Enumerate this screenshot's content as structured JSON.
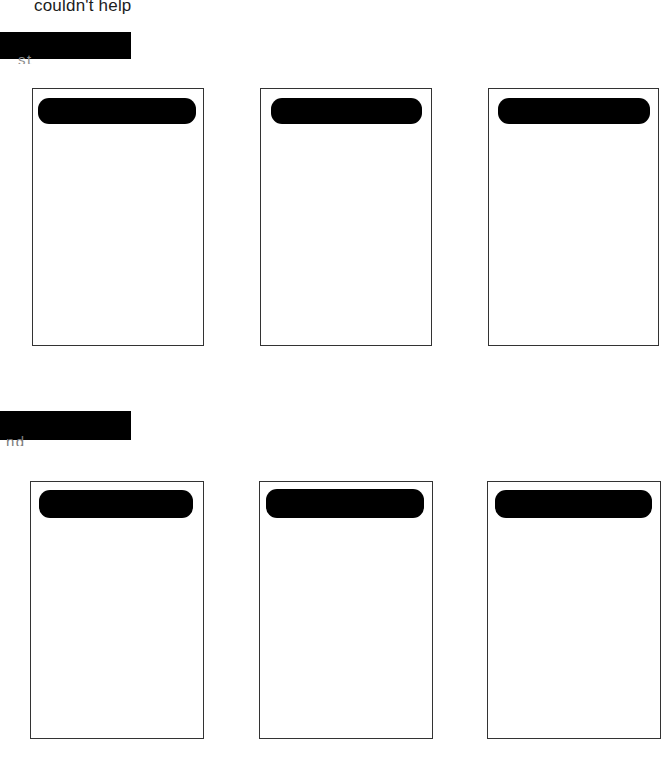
{
  "document": {
    "type": "scanned-document",
    "background_color": "#ffffff",
    "border_color": "#333333",
    "redaction_color": "#000000",
    "text_color": "#1c1c1c"
  },
  "top_text": {
    "line": "couldn't help"
  },
  "sections": [
    {
      "id": "section-1",
      "heading_redacted": true,
      "heading_remnant": "st",
      "cards": [
        {
          "id": "card-1-1",
          "header_redacted": true,
          "body_text": ""
        },
        {
          "id": "card-1-2",
          "header_redacted": true,
          "body_text": ""
        },
        {
          "id": "card-1-3",
          "header_redacted": true,
          "body_text": ""
        }
      ]
    },
    {
      "id": "section-2",
      "heading_redacted": true,
      "heading_remnant": "nd",
      "cards": [
        {
          "id": "card-2-1",
          "header_redacted": true,
          "body_text": ""
        },
        {
          "id": "card-2-2",
          "header_redacted": true,
          "body_text": ""
        },
        {
          "id": "card-2-3",
          "header_redacted": true,
          "body_text": ""
        }
      ]
    }
  ]
}
